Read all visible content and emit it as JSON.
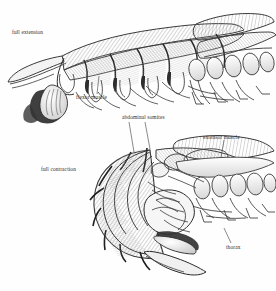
{
  "figure": {
    "width": 276,
    "height": 291,
    "background_color": "#fefefe",
    "ink_color": "#3a3a3a",
    "shade_color": "#8d8d8d",
    "label_color": "#2d2d2d"
  },
  "labels": {
    "full_extension": "full extension",
    "flexor_muscle": "flexor muscle",
    "abdominal_somites": "abdominal somites",
    "extensor_muscle": "extensor muscle",
    "full_contraction": "full contraction",
    "thorax": "thorax"
  },
  "leaders": [
    {
      "name": "flexor-muscle-leader",
      "from": [
        97,
        94
      ],
      "to": [
        99,
        76
      ]
    },
    {
      "name": "abdominal-somites-leader-1",
      "from": [
        129,
        122
      ],
      "to": [
        134,
        152
      ]
    },
    {
      "name": "abdominal-somites-leader-2",
      "from": [
        145,
        122
      ],
      "to": [
        150,
        149
      ]
    },
    {
      "name": "extensor-muscle-leader",
      "from": [
        224,
        140
      ],
      "to": [
        221,
        157
      ]
    },
    {
      "name": "thorax-leader",
      "from": [
        231,
        243
      ],
      "to": [
        224,
        228
      ]
    }
  ]
}
